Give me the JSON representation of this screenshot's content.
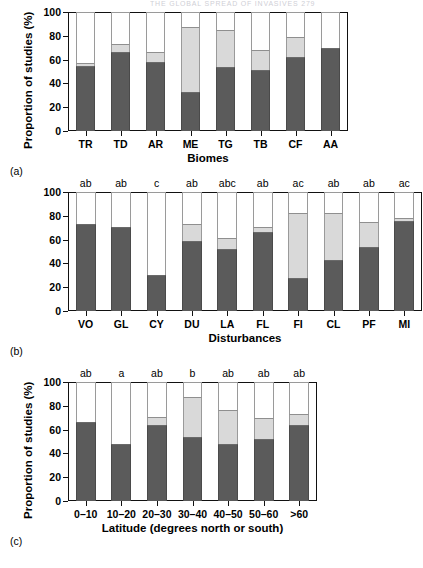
{
  "page": {
    "running_head": "THE GLOBAL SPREAD OF INVASIVES    279"
  },
  "palette": {
    "segment_1": "#5b5b5b",
    "segment_2": "#d9d9d9",
    "segment_3": "#ffffff",
    "axis": "#111111"
  },
  "y_axis": {
    "label": "Proportion of studies (%)",
    "ticks": [
      "0",
      "20",
      "40",
      "60",
      "80",
      "100"
    ],
    "min": 0,
    "max": 100
  },
  "panels": [
    {
      "tag": "(a)",
      "x_title": "Biomes",
      "categories": [
        "TR",
        "TD",
        "AR",
        "ME",
        "TG",
        "TB",
        "CF",
        "AA"
      ],
      "annotations": [
        "",
        "",
        "",
        "",
        "",
        "",
        "",
        ""
      ],
      "series_1": [
        55,
        66,
        58,
        33,
        54,
        51,
        62,
        70
      ],
      "series_2": [
        2,
        7,
        8,
        54,
        31,
        17,
        17,
        0
      ],
      "series_3": [
        43,
        27,
        34,
        13,
        15,
        32,
        21,
        30
      ]
    },
    {
      "tag": "(b)",
      "x_title": "Disturbances",
      "categories": [
        "VO",
        "GL",
        "CY",
        "DU",
        "LA",
        "FL",
        "FI",
        "CL",
        "PF",
        "MI"
      ],
      "annotations": [
        "ab",
        "ab",
        "c",
        "ab",
        "abc",
        "ab",
        "ac",
        "ab",
        "ab",
        "ac"
      ],
      "series_1": [
        73,
        70.5,
        30,
        58.5,
        52,
        66.5,
        27.5,
        43,
        54,
        75.5
      ],
      "series_2": [
        0,
        0,
        0,
        15,
        9,
        4,
        55,
        39,
        21,
        3
      ],
      "series_3": [
        27,
        29.5,
        70,
        26.5,
        39,
        29.5,
        17.5,
        18,
        25,
        21.5
      ]
    },
    {
      "tag": "(c)",
      "x_title": "Latitude (degrees north or south)",
      "categories": [
        "0–10",
        "10–20",
        "20–30",
        "30–40",
        "40–50",
        "50–60",
        ">60"
      ],
      "annotations": [
        "ab",
        "a",
        "ab",
        "b",
        "ab",
        "ab",
        "ab"
      ],
      "series_1": [
        66.5,
        48,
        63.5,
        53.5,
        48,
        52.5,
        64
      ],
      "series_2": [
        0,
        0,
        7.5,
        34,
        28.5,
        17.5,
        9
      ],
      "series_3": [
        33.5,
        52,
        29,
        12.5,
        23.5,
        30,
        27
      ]
    }
  ],
  "chart_data": {
    "type": "bar",
    "title": "",
    "subtitle": "",
    "ylabel": "Proportion of studies (%)",
    "ylim": [
      0,
      100
    ],
    "grid": false,
    "legend_position": "none",
    "stacked": true,
    "charts": [
      {
        "panel": "(a)",
        "xlabel": "Biomes",
        "categories": [
          "TR",
          "TD",
          "AR",
          "ME",
          "TG",
          "TB",
          "CF",
          "AA"
        ],
        "series": [
          {
            "name": "dark-gray",
            "values": [
              55,
              66,
              58,
              33,
              54,
              51,
              62,
              70
            ]
          },
          {
            "name": "light-gray",
            "values": [
              2,
              7,
              8,
              54,
              31,
              17,
              17,
              0
            ]
          },
          {
            "name": "white",
            "values": [
              43,
              27,
              34,
              13,
              15,
              32,
              21,
              30
            ]
          }
        ],
        "cumulative_tops": [
          [
            55,
            57,
            100
          ],
          [
            66,
            73,
            100
          ],
          [
            58,
            66,
            100
          ],
          [
            33,
            87,
            100
          ],
          [
            54,
            85,
            100
          ],
          [
            51,
            68,
            100
          ],
          [
            62,
            79,
            100
          ],
          [
            70,
            70,
            100
          ]
        ],
        "annotations": []
      },
      {
        "panel": "(b)",
        "xlabel": "Disturbances",
        "categories": [
          "VO",
          "GL",
          "CY",
          "DU",
          "LA",
          "FL",
          "FI",
          "CL",
          "PF",
          "MI"
        ],
        "series": [
          {
            "name": "dark-gray",
            "values": [
              73,
              70.5,
              30,
              58.5,
              52,
              66.5,
              27.5,
              43,
              54,
              75.5
            ]
          },
          {
            "name": "light-gray",
            "values": [
              0,
              0,
              0,
              15,
              9,
              4,
              55,
              39,
              21,
              3
            ]
          },
          {
            "name": "white",
            "values": [
              27,
              29.5,
              70,
              26.5,
              39,
              29.5,
              17.5,
              18,
              25,
              21.5
            ]
          }
        ],
        "cumulative_tops": [
          [
            73,
            73,
            100
          ],
          [
            70.5,
            70.5,
            100
          ],
          [
            30,
            30,
            100
          ],
          [
            58.5,
            73.5,
            100
          ],
          [
            52,
            61,
            100
          ],
          [
            66.5,
            70.5,
            100
          ],
          [
            27.5,
            82.5,
            100
          ],
          [
            43,
            82,
            100
          ],
          [
            54,
            75,
            100
          ],
          [
            75.5,
            78.5,
            100
          ]
        ],
        "annotations": [
          "ab",
          "ab",
          "c",
          "ab",
          "abc",
          "ab",
          "ac",
          "ab",
          "ab",
          "ac"
        ]
      },
      {
        "panel": "(c)",
        "xlabel": "Latitude (degrees north or south)",
        "categories": [
          "0–10",
          "10–20",
          "20–30",
          "30–40",
          "40–50",
          "50–60",
          ">60"
        ],
        "series": [
          {
            "name": "dark-gray",
            "values": [
              66.5,
              48,
              63.5,
              53.5,
              48,
              52.5,
              64
            ]
          },
          {
            "name": "light-gray",
            "values": [
              0,
              0,
              7.5,
              34,
              28.5,
              17.5,
              9
            ]
          },
          {
            "name": "white",
            "values": [
              33.5,
              52,
              29,
              12.5,
              23.5,
              30,
              27
            ]
          }
        ],
        "cumulative_tops": [
          [
            66.5,
            66.5,
            100
          ],
          [
            48,
            48,
            100
          ],
          [
            63.5,
            71,
            100
          ],
          [
            53.5,
            87.5,
            100
          ],
          [
            48,
            76.5,
            100
          ],
          [
            52.5,
            70,
            100
          ],
          [
            64,
            73,
            100
          ]
        ],
        "annotations": [
          "ab",
          "a",
          "ab",
          "b",
          "ab",
          "ab",
          "ab"
        ]
      }
    ]
  }
}
